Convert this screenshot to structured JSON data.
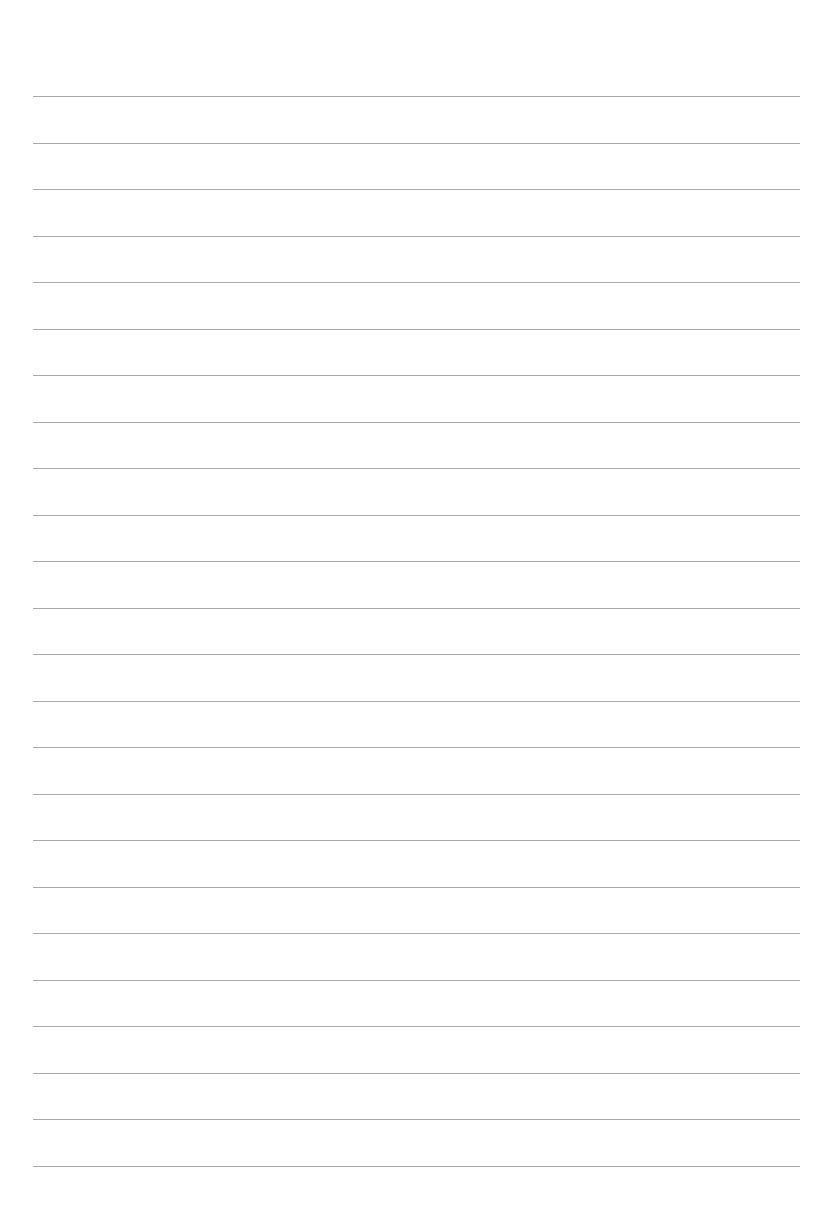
{
  "page": {
    "type": "lined-paper",
    "background": "#ffffff",
    "rule_color": "#9a9a9a",
    "rule_count": 24,
    "first_rule_y": 96,
    "rule_spacing": 46.5,
    "rule_left": 33,
    "rule_right": 800
  }
}
